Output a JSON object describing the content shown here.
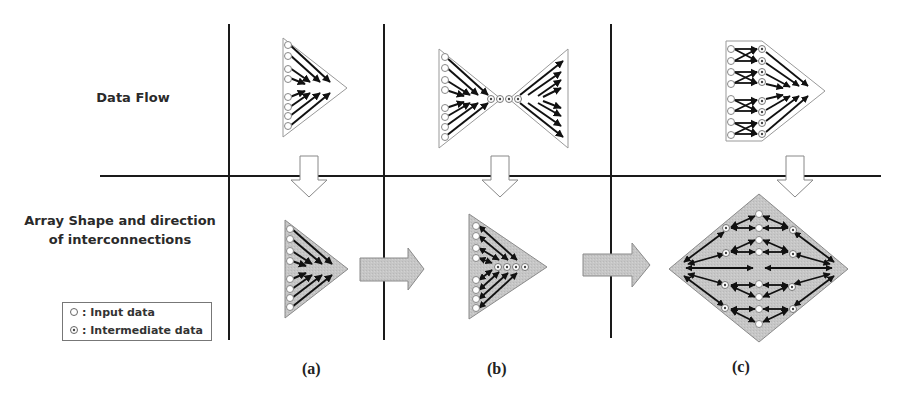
{
  "rows": {
    "data_flow": "Data Flow",
    "array_shape_line1": "Array Shape and direction",
    "array_shape_line2": "of interconnections"
  },
  "legend": {
    "items": [
      {
        "symbol": "open-circle",
        "label": "Input data"
      },
      {
        "symbol": "dotted-circle",
        "label": "Intermediate data"
      }
    ],
    "separator": ":"
  },
  "columns": [
    {
      "caption": "(a)",
      "data_flow": "triangle-reduction",
      "array_shape": "triangle"
    },
    {
      "caption": "(b)",
      "data_flow": "butterfly-reduction-broadcast",
      "array_shape": "triangle-with-intermediate"
    },
    {
      "caption": "(c)",
      "data_flow": "exchange-then-reduction",
      "array_shape": "diamond"
    }
  ],
  "colors": {
    "line": "#1a1a1a",
    "shape_fill": "#c8c8c8",
    "shape_stroke": "#8a8a8a",
    "arrow_fill": "#c4c4c4",
    "text": "#2a2a2a"
  }
}
